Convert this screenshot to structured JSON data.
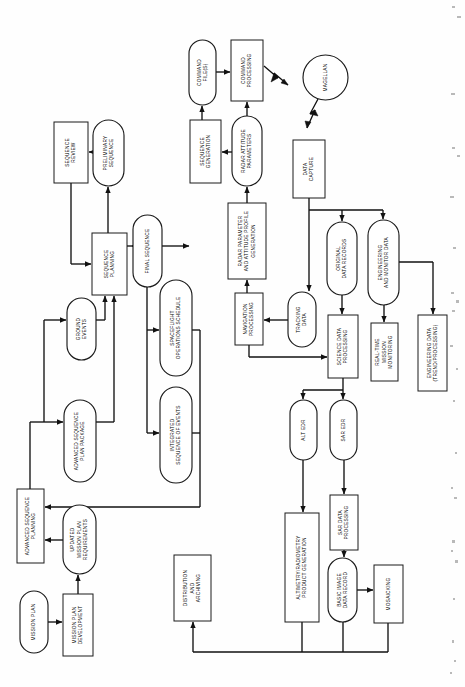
{
  "diagram": {
    "orientation": "rotated-90-ccw",
    "stroke_color": "#111111",
    "fill_color": "#ffffff"
  },
  "nodes": [
    {
      "id": "sequence_review",
      "label": "SEQUENCE\nREVIEW",
      "shape": "rect",
      "x": 54,
      "y": 122,
      "w": 34,
      "h": 61
    },
    {
      "id": "preliminary_sequence",
      "label": "PRELIMINARY\nSEQUENCE",
      "shape": "stadium",
      "x": 93,
      "y": 120,
      "w": 31,
      "h": 66
    },
    {
      "id": "sequence_planning",
      "label": "SEQUENCE\nPLANNING",
      "shape": "rect",
      "x": 92,
      "y": 233,
      "w": 35,
      "h": 62
    },
    {
      "id": "command_files",
      "label": "COMMAND\nFILE(S)",
      "shape": "stadium",
      "x": 189,
      "y": 40,
      "w": 27,
      "h": 65
    },
    {
      "id": "command_processing",
      "label": "COMMAND\nPROCESSING",
      "shape": "rect",
      "x": 231,
      "y": 40,
      "w": 32,
      "h": 61
    },
    {
      "id": "magellan",
      "label": "MAGELLAN",
      "shape": "circle",
      "x": 303,
      "y": 55,
      "w": 45,
      "h": 45
    },
    {
      "id": "sequence_generation",
      "label": "SEQUENCE\nGENERATION",
      "shape": "rect",
      "x": 190,
      "y": 120,
      "w": 31,
      "h": 63
    },
    {
      "id": "radar_attitude_params",
      "label": "RADAR ATTITUDE\nPARAMETERS",
      "shape": "stadium",
      "x": 232,
      "y": 116,
      "w": 30,
      "h": 70
    },
    {
      "id": "data_capture",
      "label": "DATA\nCAPTURE",
      "shape": "rect",
      "x": 293,
      "y": 140,
      "w": 32,
      "h": 58
    },
    {
      "id": "radar_param_gen",
      "label": "RADAR PARAMETER\nAND ATTITUDE PROFILE\nGENERATION",
      "shape": "rect",
      "x": 228,
      "y": 203,
      "w": 38,
      "h": 76
    },
    {
      "id": "final_sequence",
      "label": "FINAL SEQUENCE",
      "shape": "stadium",
      "x": 133,
      "y": 215,
      "w": 29,
      "h": 72
    },
    {
      "id": "spaceflight_ops",
      "label": "SPACEFLIGHT\nOPERATIONS SCHEDULE",
      "shape": "stadium",
      "x": 160,
      "y": 280,
      "w": 32,
      "h": 96
    },
    {
      "id": "integrated_seq_events",
      "label": "INTEGRATED\nSEQUENCE OF EVENTS",
      "shape": "stadium",
      "x": 160,
      "y": 387,
      "w": 32,
      "h": 96
    },
    {
      "id": "ground_events",
      "label": "GROUND\nEVENTS",
      "shape": "stadium",
      "x": 67,
      "y": 298,
      "w": 29,
      "h": 62
    },
    {
      "id": "adv_seq_plan_package",
      "label": "ADVANCED SEQUENCE\nPLAN PACKAGE",
      "shape": "stadium",
      "x": 64,
      "y": 400,
      "w": 32,
      "h": 82
    },
    {
      "id": "navigation_processing",
      "label": "NAVIGATION\nPROCESSING",
      "shape": "rect",
      "x": 235,
      "y": 293,
      "w": 28,
      "h": 52
    },
    {
      "id": "tracking_data",
      "label": "TRACKING\nDATA",
      "shape": "stadium",
      "x": 288,
      "y": 292,
      "w": 28,
      "h": 55
    },
    {
      "id": "original_data_records",
      "label": "ORIGINAL\nDATA RECORDS",
      "shape": "stadium",
      "x": 327,
      "y": 222,
      "w": 30,
      "h": 73
    },
    {
      "id": "eng_monitor_data",
      "label": "ENGINEERING\nAND MONITOR DATA",
      "shape": "stadium",
      "x": 368,
      "y": 220,
      "w": 31,
      "h": 85
    },
    {
      "id": "science_data_proc",
      "label": "SCIENCE DATA\nPROCESSING",
      "shape": "rect",
      "x": 328,
      "y": 315,
      "w": 30,
      "h": 63
    },
    {
      "id": "realtime_monitoring",
      "label": "REAL-TIME\nMISSION\nMONITORING",
      "shape": "rect",
      "x": 371,
      "y": 323,
      "w": 27,
      "h": 58
    },
    {
      "id": "engineering_data",
      "label": "ENGINEERING DATA\n(TREND/PROCESSING)",
      "shape": "rect",
      "x": 418,
      "y": 315,
      "w": 29,
      "h": 76
    },
    {
      "id": "alt_edr",
      "label": "ALT EDR",
      "shape": "stadium",
      "x": 290,
      "y": 400,
      "w": 27,
      "h": 60
    },
    {
      "id": "sar_edr",
      "label": "SAR EDR",
      "shape": "stadium",
      "x": 330,
      "y": 400,
      "w": 27,
      "h": 60
    },
    {
      "id": "sar_data_processing",
      "label": "SAR DATA\nPROCESSING",
      "shape": "rect",
      "x": 330,
      "y": 495,
      "w": 28,
      "h": 55
    },
    {
      "id": "altimetry_product",
      "label": "ALTIMETRY/RADIOMETRY\nPRODUCT GENERATION",
      "shape": "rect",
      "x": 285,
      "y": 513,
      "w": 34,
      "h": 109
    },
    {
      "id": "basic_image_record",
      "label": "BASIC IMAGE\nDATA RECORD",
      "shape": "stadium",
      "x": 328,
      "y": 558,
      "w": 29,
      "h": 64
    },
    {
      "id": "mosaicking",
      "label": "MOSAICKING",
      "shape": "rect",
      "x": 374,
      "y": 565,
      "w": 29,
      "h": 58
    },
    {
      "id": "distribution_archiving",
      "label": "DISTRIBUTION\nAND\nARCHIVING",
      "shape": "rect",
      "x": 174,
      "y": 555,
      "w": 37,
      "h": 66
    },
    {
      "id": "adv_seq_planning",
      "label": "ADVANCED SEQUENCE\nPLANNING",
      "shape": "rect",
      "x": 17,
      "y": 489,
      "w": 27,
      "h": 74
    },
    {
      "id": "updated_mission_req",
      "label": "UPDATED\nMISSION PLAN\nREQUIREMENTS",
      "shape": "stadium",
      "x": 63,
      "y": 505,
      "w": 33,
      "h": 69
    },
    {
      "id": "mission_plan",
      "label": "MISSION PLAN",
      "shape": "stadium",
      "x": 20,
      "y": 591,
      "w": 28,
      "h": 62
    },
    {
      "id": "mission_plan_dev",
      "label": "MISSION PLAN\nDEVELOPMENT",
      "shape": "rect",
      "x": 63,
      "y": 594,
      "w": 30,
      "h": 62
    }
  ],
  "edges": [
    {
      "from": "preliminary_sequence",
      "to": "sequence_review",
      "type": "arrow"
    },
    {
      "from": "sequence_planning",
      "to": "preliminary_sequence",
      "type": "arrow"
    },
    {
      "from": "sequence_review",
      "to": "sequence_planning",
      "type": "feedback-loop"
    },
    {
      "from": "command_files",
      "to": "command_processing",
      "type": "arrow"
    },
    {
      "from": "command_processing",
      "to": "magellan",
      "type": "rf-link"
    },
    {
      "from": "magellan",
      "to": "data_capture",
      "type": "rf-link"
    },
    {
      "from": "sequence_generation",
      "to": "command_files",
      "type": "arrow"
    },
    {
      "from": "radar_attitude_params",
      "to": "sequence_generation",
      "type": "arrow"
    },
    {
      "from": "radar_attitude_params",
      "to": "command_processing",
      "type": "arrow"
    },
    {
      "from": "radar_param_gen",
      "to": "radar_attitude_params",
      "type": "arrow"
    },
    {
      "from": "navigation_processing",
      "to": "radar_param_gen",
      "type": "arrow"
    },
    {
      "from": "tracking_data",
      "to": "navigation_processing",
      "type": "arrow"
    },
    {
      "from": "data_capture",
      "to": "tracking_data",
      "type": "arrow"
    },
    {
      "from": "data_capture",
      "to": "original_data_records",
      "type": "arrow"
    },
    {
      "from": "data_capture",
      "to": "eng_monitor_data",
      "type": "arrow"
    },
    {
      "from": "original_data_records",
      "to": "science_data_proc",
      "type": "arrow"
    },
    {
      "from": "eng_monitor_data",
      "to": "realtime_monitoring",
      "type": "arrow"
    },
    {
      "from": "eng_monitor_data",
      "to": "engineering_data",
      "type": "arrow"
    },
    {
      "from": "navigation_processing",
      "to": "science_data_proc",
      "type": "arrow"
    },
    {
      "from": "science_data_proc",
      "to": "alt_edr",
      "type": "arrow"
    },
    {
      "from": "science_data_proc",
      "to": "sar_edr",
      "type": "arrow"
    },
    {
      "from": "alt_edr",
      "to": "altimetry_product",
      "type": "arrow"
    },
    {
      "from": "sar_edr",
      "to": "sar_data_processing",
      "type": "arrow"
    },
    {
      "from": "sar_data_processing",
      "to": "basic_image_record",
      "type": "arrow"
    },
    {
      "from": "basic_image_record",
      "to": "mosaicking",
      "type": "arrow"
    },
    {
      "from": "altimetry_product",
      "to": "distribution_archiving",
      "type": "arrow"
    },
    {
      "from": "basic_image_record",
      "to": "distribution_archiving",
      "type": "arrow"
    },
    {
      "from": "mosaicking",
      "to": "distribution_archiving",
      "type": "arrow"
    },
    {
      "from": "sequence_planning",
      "to": "final_sequence",
      "type": "arrow"
    },
    {
      "from": "sequence_planning",
      "to": "spaceflight_ops",
      "type": "arrow"
    },
    {
      "from": "sequence_planning",
      "to": "integrated_seq_events",
      "type": "arrow"
    },
    {
      "from": "final_sequence",
      "to": "sequence_generation",
      "type": "arrow"
    },
    {
      "from": "ground_events",
      "to": "sequence_planning",
      "type": "arrow"
    },
    {
      "from": "adv_seq_plan_package",
      "to": "sequence_planning",
      "type": "arrow"
    },
    {
      "from": "adv_seq_planning",
      "to": "ground_events",
      "type": "arrow"
    },
    {
      "from": "adv_seq_planning",
      "to": "adv_seq_plan_package",
      "type": "arrow"
    },
    {
      "from": "updated_mission_req",
      "to": "adv_seq_planning",
      "type": "arrow"
    },
    {
      "from": "mission_plan",
      "to": "mission_plan_dev",
      "type": "arrow"
    },
    {
      "from": "mission_plan_dev",
      "to": "updated_mission_req",
      "type": "arrow"
    },
    {
      "from": "spaceflight_ops",
      "to": "adv_seq_planning",
      "type": "feedback-loop"
    },
    {
      "from": "integrated_seq_events",
      "to": "adv_seq_planning",
      "type": "feedback-loop"
    }
  ]
}
